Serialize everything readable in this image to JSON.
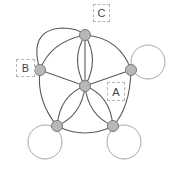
{
  "diagram": {
    "type": "graph",
    "nodes": [
      {
        "id": "center",
        "x": 85,
        "y": 86
      },
      {
        "id": "top",
        "x": 85,
        "y": 35
      },
      {
        "id": "left",
        "x": 40,
        "y": 70
      },
      {
        "id": "right",
        "x": 131,
        "y": 70
      },
      {
        "id": "bottom-left",
        "x": 57,
        "y": 126
      },
      {
        "id": "bottom-right",
        "x": 113,
        "y": 126
      }
    ],
    "labels": [
      {
        "id": "label-a",
        "text": "A",
        "attached_to": "center"
      },
      {
        "id": "label-b",
        "text": "B",
        "attached_to": "left"
      },
      {
        "id": "label-c",
        "text": "C",
        "attached_to": "top"
      }
    ],
    "loops": [
      "right",
      "bottom-left",
      "bottom-right"
    ],
    "colors": {
      "edge": "#5a5a5a",
      "loop": "#a8a8a8",
      "node_fill": "#b8b8b8",
      "node_stroke": "#7a7a7a",
      "label_border": "#b5b5b5"
    }
  }
}
